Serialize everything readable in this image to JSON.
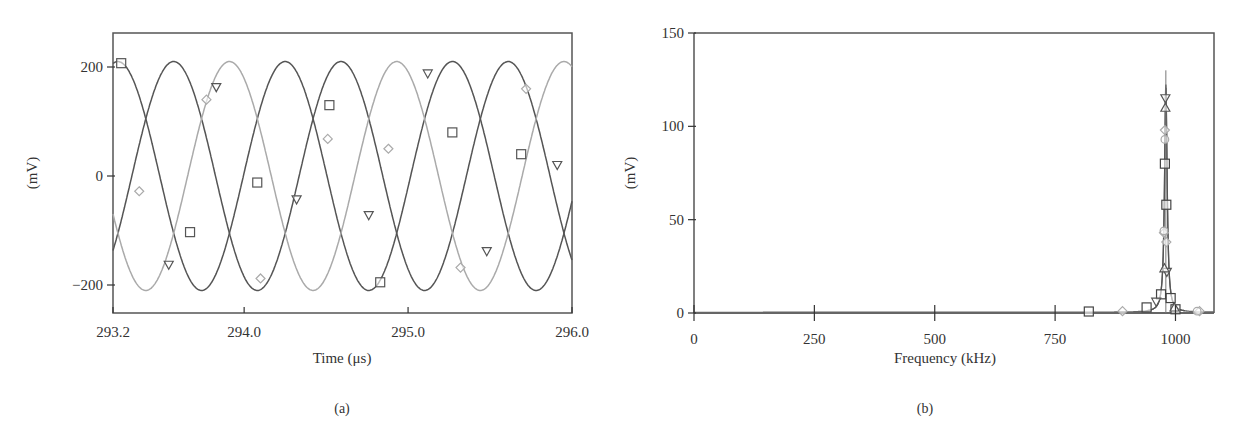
{
  "chart_data": [
    {
      "type": "line",
      "panel_label": "(a)",
      "title": "",
      "xlabel": "Time (μs)",
      "ylabel": "(mV)",
      "xlim": [
        293.2,
        296.0
      ],
      "ylim": [
        -260,
        270
      ],
      "xticks": [
        293.2,
        294.0,
        295.0,
        296.0
      ],
      "xtick_labels": [
        "293.2",
        "294.0",
        "295.0",
        "296.0"
      ],
      "yticks": [
        -200,
        0,
        200
      ],
      "ytick_labels": [
        "−200",
        "0",
        "200"
      ],
      "grid": false,
      "legend": null,
      "frequency_kHz": 980,
      "amplitude_mV": 210,
      "series": [
        {
          "name": "phase-square",
          "marker": "square",
          "color": "#555555",
          "phase_deg": 90,
          "marker_points": [
            [
              293.25,
              207
            ],
            [
              293.67,
              -103
            ],
            [
              294.08,
              -12
            ],
            [
              294.52,
              130
            ],
            [
              294.83,
              -195
            ],
            [
              295.27,
              80
            ],
            [
              295.69,
              40
            ]
          ]
        },
        {
          "name": "phase-triangle",
          "marker": "triangle-down",
          "color": "#555555",
          "phase_deg": -30,
          "marker_points": [
            [
              293.54,
              -163
            ],
            [
              293.83,
              163
            ],
            [
              294.32,
              -43
            ],
            [
              294.76,
              -72
            ],
            [
              295.12,
              188
            ],
            [
              295.48,
              -138
            ],
            [
              295.91,
              20
            ]
          ]
        },
        {
          "name": "phase-diamond",
          "marker": "diamond",
          "color": "#aaaaaa",
          "phase_deg": 210,
          "marker_points": [
            [
              293.36,
              -28
            ],
            [
              293.77,
              140
            ],
            [
              294.1,
              -188
            ],
            [
              294.51,
              68
            ],
            [
              294.88,
              50
            ],
            [
              295.32,
              -168
            ],
            [
              295.72,
              160
            ]
          ]
        }
      ]
    },
    {
      "type": "line",
      "panel_label": "(b)",
      "title": "",
      "xlabel": "Frequency (kHz)",
      "ylabel": "(mV)",
      "xlim": [
        0,
        1080
      ],
      "ylim": [
        0,
        150
      ],
      "xticks": [
        0,
        250,
        500,
        750,
        1000
      ],
      "xtick_labels": [
        "0",
        "250",
        "500",
        "750",
        "1000"
      ],
      "yticks": [
        0,
        50,
        100,
        150
      ],
      "ytick_labels": [
        "0",
        "50",
        "100",
        "150"
      ],
      "grid": false,
      "legend": null,
      "peak_frequency_kHz": 980,
      "peak_value_mV": 122,
      "series": [
        {
          "name": "spectrum-square",
          "marker": "square",
          "points": [
            [
              0,
              0
            ],
            [
              700,
              0.3
            ],
            [
              820,
              0.8
            ],
            [
              940,
              3
            ],
            [
              970,
              10
            ],
            [
              978,
              80
            ],
            [
              981,
              58
            ],
            [
              990,
              8
            ],
            [
              1000,
              2
            ],
            [
              1080,
              0.3
            ]
          ]
        },
        {
          "name": "spectrum-triangle-down",
          "marker": "triangle-down",
          "points": [
            [
              0,
              0
            ],
            [
              960,
              6
            ],
            [
              979,
              115
            ],
            [
              982,
              22
            ],
            [
              1080,
              0.3
            ]
          ]
        },
        {
          "name": "spectrum-triangle-up",
          "marker": "triangle-up",
          "points": [
            [
              0,
              0
            ],
            [
              977,
              24
            ],
            [
              979,
              110
            ],
            [
              998,
              3
            ],
            [
              1080,
              0.3
            ]
          ]
        },
        {
          "name": "spectrum-diamond",
          "marker": "diamond",
          "points": [
            [
              0,
              0
            ],
            [
              890,
              1
            ],
            [
              976,
              43
            ],
            [
              978,
              98
            ],
            [
              981,
              38
            ],
            [
              1050,
              1
            ],
            [
              1080,
              0.3
            ]
          ]
        },
        {
          "name": "spectrum-circle",
          "marker": "circle",
          "points": [
            [
              0,
              0
            ],
            [
              978,
              93
            ],
            [
              976,
              44
            ],
            [
              1045,
              1
            ]
          ]
        }
      ]
    }
  ]
}
